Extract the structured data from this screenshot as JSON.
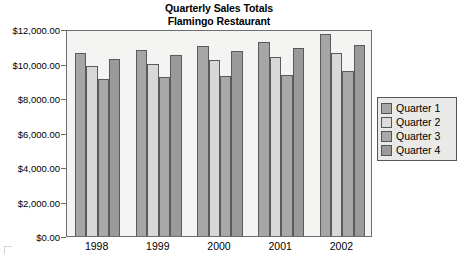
{
  "chart_data": {
    "type": "bar",
    "title": "Quarterly Sales Totals Flamingo Restaurant",
    "title_lines": [
      "Quarterly Sales Totals",
      "Flamingo Restaurant"
    ],
    "xlabel": "",
    "ylabel": "",
    "ylim": [
      0,
      12000
    ],
    "grid": false,
    "legend_position": "right",
    "categories": [
      "1998",
      "1999",
      "2000",
      "2001",
      "2002"
    ],
    "y_ticks": [
      0,
      2000,
      4000,
      6000,
      8000,
      10000,
      12000
    ],
    "y_tick_labels": [
      "$0.00",
      "$2,000.00",
      "$4,000.00",
      "$6,000.00",
      "$8,000.00",
      "$10,000.00",
      "$12,000.00"
    ],
    "series": [
      {
        "name": "Quarter 1",
        "color": "#a6a6a6",
        "values": [
          10600,
          10800,
          11000,
          11250,
          11700
        ]
      },
      {
        "name": "Quarter 2",
        "color": "#d8d8d8",
        "values": [
          9850,
          10000,
          10200,
          10350,
          10600
        ]
      },
      {
        "name": "Quarter 3",
        "color": "#a8a8a8",
        "values": [
          9100,
          9200,
          9250,
          9350,
          9550
        ]
      },
      {
        "name": "Quarter 4",
        "color": "#9a9a9a",
        "values": [
          10250,
          10500,
          10750,
          10900,
          11100
        ]
      }
    ]
  },
  "legend": {
    "items": [
      {
        "label": "Quarter 1"
      },
      {
        "label": "Quarter 2"
      },
      {
        "label": "Quarter 3"
      },
      {
        "label": "Quarter 4"
      }
    ]
  }
}
